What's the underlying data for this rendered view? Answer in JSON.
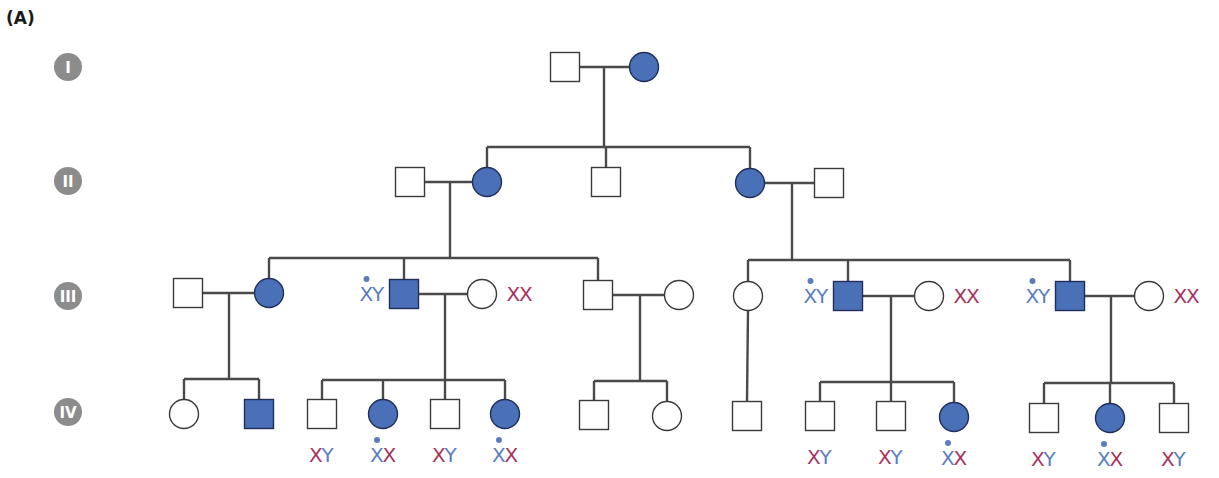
{
  "panel_label": "(A)",
  "colors": {
    "affected_fill": "#4a70b8",
    "unaffected_fill": "#ffffff",
    "x_mutant": "#5b7dc0",
    "x_normal": "#a6335f",
    "y": "#5b7dc0",
    "badge": "#8c8c8c"
  },
  "generations": [
    {
      "label": "I",
      "y": 67
    },
    {
      "label": "II",
      "y": 181
    },
    {
      "label": "III",
      "y": 296
    },
    {
      "label": "IV",
      "y": 412
    }
  ],
  "individuals": [
    {
      "id": "I-1",
      "sex": "male",
      "affected": false,
      "x": 565,
      "y": 67
    },
    {
      "id": "I-2",
      "sex": "female",
      "affected": true,
      "x": 644,
      "y": 67
    },
    {
      "id": "II-1",
      "sex": "male",
      "affected": false,
      "x": 410,
      "y": 182
    },
    {
      "id": "II-2",
      "sex": "female",
      "affected": true,
      "x": 487,
      "y": 182
    },
    {
      "id": "II-3",
      "sex": "male",
      "affected": false,
      "x": 606,
      "y": 182
    },
    {
      "id": "II-4",
      "sex": "female",
      "affected": true,
      "x": 750,
      "y": 183
    },
    {
      "id": "II-5",
      "sex": "male",
      "affected": false,
      "x": 829,
      "y": 183
    },
    {
      "id": "III-1",
      "sex": "male",
      "affected": false,
      "x": 188,
      "y": 293
    },
    {
      "id": "III-2",
      "sex": "female",
      "affected": true,
      "x": 269,
      "y": 293
    },
    {
      "id": "III-3",
      "sex": "male",
      "affected": true,
      "x": 404,
      "y": 294,
      "genotype": [
        {
          "t": "X",
          "mut": true
        },
        {
          "t": "Y"
        }
      ],
      "geno_side": "left"
    },
    {
      "id": "III-4",
      "sex": "female",
      "affected": false,
      "x": 482,
      "y": 294,
      "genotype": [
        {
          "t": "X"
        },
        {
          "t": "X"
        }
      ],
      "geno_side": "right"
    },
    {
      "id": "III-5",
      "sex": "male",
      "affected": false,
      "x": 598,
      "y": 295
    },
    {
      "id": "III-6",
      "sex": "female",
      "affected": false,
      "x": 679,
      "y": 295
    },
    {
      "id": "III-7",
      "sex": "female",
      "affected": false,
      "x": 748,
      "y": 296
    },
    {
      "id": "III-8",
      "sex": "male",
      "affected": true,
      "x": 848,
      "y": 296,
      "genotype": [
        {
          "t": "X",
          "mut": true
        },
        {
          "t": "Y"
        }
      ],
      "geno_side": "left"
    },
    {
      "id": "III-9",
      "sex": "female",
      "affected": false,
      "x": 929,
      "y": 296,
      "genotype": [
        {
          "t": "X"
        },
        {
          "t": "X"
        }
      ],
      "geno_side": "right"
    },
    {
      "id": "III-10",
      "sex": "male",
      "affected": true,
      "x": 1070,
      "y": 296,
      "genotype": [
        {
          "t": "X",
          "mut": true
        },
        {
          "t": "Y"
        }
      ],
      "geno_side": "left"
    },
    {
      "id": "III-11",
      "sex": "female",
      "affected": false,
      "x": 1149,
      "y": 296,
      "genotype": [
        {
          "t": "X"
        },
        {
          "t": "X"
        }
      ],
      "geno_side": "right"
    },
    {
      "id": "IV-1",
      "sex": "female",
      "affected": false,
      "x": 184,
      "y": 414
    },
    {
      "id": "IV-2",
      "sex": "male",
      "affected": true,
      "x": 259,
      "y": 414
    },
    {
      "id": "IV-3",
      "sex": "male",
      "affected": false,
      "x": 322,
      "y": 414,
      "genotype": [
        {
          "t": "X"
        },
        {
          "t": "Y"
        }
      ],
      "geno_side": "below"
    },
    {
      "id": "IV-4",
      "sex": "female",
      "affected": true,
      "x": 383,
      "y": 414,
      "genotype": [
        {
          "t": "X",
          "mut": true
        },
        {
          "t": "X"
        }
      ],
      "geno_side": "below"
    },
    {
      "id": "IV-5",
      "sex": "male",
      "affected": false,
      "x": 445,
      "y": 414,
      "genotype": [
        {
          "t": "X"
        },
        {
          "t": "Y"
        }
      ],
      "geno_side": "below"
    },
    {
      "id": "IV-6",
      "sex": "female",
      "affected": true,
      "x": 505,
      "y": 414,
      "genotype": [
        {
          "t": "X",
          "mut": true
        },
        {
          "t": "X"
        }
      ],
      "geno_side": "below"
    },
    {
      "id": "IV-7",
      "sex": "male",
      "affected": false,
      "x": 594,
      "y": 415
    },
    {
      "id": "IV-8",
      "sex": "female",
      "affected": false,
      "x": 667,
      "y": 416
    },
    {
      "id": "IV-9",
      "sex": "male",
      "affected": false,
      "x": 747,
      "y": 416
    },
    {
      "id": "IV-10",
      "sex": "male",
      "affected": false,
      "x": 820,
      "y": 416,
      "genotype": [
        {
          "t": "X"
        },
        {
          "t": "Y"
        }
      ],
      "geno_side": "below"
    },
    {
      "id": "IV-11",
      "sex": "male",
      "affected": false,
      "x": 891,
      "y": 416,
      "genotype": [
        {
          "t": "X"
        },
        {
          "t": "Y"
        }
      ],
      "geno_side": "below"
    },
    {
      "id": "IV-12",
      "sex": "female",
      "affected": true,
      "x": 954,
      "y": 417,
      "genotype": [
        {
          "t": "X",
          "mut": true
        },
        {
          "t": "X"
        }
      ],
      "geno_side": "below"
    },
    {
      "id": "IV-13",
      "sex": "male",
      "affected": false,
      "x": 1044,
      "y": 418,
      "genotype": [
        {
          "t": "X"
        },
        {
          "t": "Y"
        }
      ],
      "geno_side": "below"
    },
    {
      "id": "IV-14",
      "sex": "female",
      "affected": true,
      "x": 1110,
      "y": 418,
      "genotype": [
        {
          "t": "X",
          "mut": true
        },
        {
          "t": "X"
        }
      ],
      "geno_side": "below"
    },
    {
      "id": "IV-15",
      "sex": "male",
      "affected": false,
      "x": 1174,
      "y": 418,
      "genotype": [
        {
          "t": "X"
        },
        {
          "t": "Y"
        }
      ],
      "geno_side": "below"
    }
  ],
  "matings": [
    {
      "a": "I-1",
      "b": "I-2",
      "drop_x": 604,
      "sib_y": 147,
      "children": [
        "II-2",
        "II-3",
        "II-4"
      ]
    },
    {
      "a": "II-1",
      "b": "II-2",
      "drop_x": 450,
      "sib_y": 258,
      "children": [
        "III-2",
        "III-3",
        "III-5"
      ]
    },
    {
      "a": "II-4",
      "b": "II-5",
      "drop_x": 792,
      "sib_y": 260,
      "children": [
        "III-7",
        "III-8",
        "III-10"
      ]
    },
    {
      "a": "III-1",
      "b": "III-2",
      "drop_x": 229,
      "sib_y": 379,
      "children": [
        "IV-1",
        "IV-2"
      ]
    },
    {
      "a": "III-3",
      "b": "III-4",
      "drop_x": 445,
      "sib_y": 380,
      "children": [
        "IV-3",
        "IV-4",
        "IV-5",
        "IV-6"
      ]
    },
    {
      "a": "III-5",
      "b": "III-6",
      "drop_x": 640,
      "sib_y": 381,
      "children": [
        "IV-7",
        "IV-8"
      ]
    },
    {
      "a": "III-8",
      "b": "III-9",
      "drop_x": 891,
      "sib_y": 382,
      "children": [
        "IV-10",
        "IV-11",
        "IV-12"
      ]
    },
    {
      "a": "III-10",
      "b": "III-11",
      "drop_x": 1111,
      "sib_y": 383,
      "children": [
        "IV-13",
        "IV-14",
        "IV-15"
      ]
    }
  ],
  "single_descents": [
    {
      "from": "III-7",
      "to": "IV-9"
    }
  ]
}
